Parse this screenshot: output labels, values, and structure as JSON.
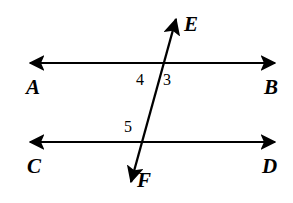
{
  "figure": {
    "background_color": "#ffffff",
    "stroke_color": "#000000",
    "width": 293,
    "height": 203
  },
  "lines": [
    {
      "name": "line-ab",
      "description": "upper horizontal line with arrowheads on both ends",
      "start_label": "A",
      "end_label": "B",
      "x1": 30,
      "y1": 63,
      "x2": 275,
      "y2": 63,
      "arrow_start": true,
      "arrow_end": true
    },
    {
      "name": "line-cd",
      "description": "lower horizontal line with arrowheads on both ends",
      "start_label": "C",
      "end_label": "D",
      "x1": 30,
      "y1": 142,
      "x2": 275,
      "y2": 142,
      "arrow_start": true,
      "arrow_end": true
    },
    {
      "name": "line-ef",
      "description": "transversal line with arrowheads on both ends",
      "start_label": "F",
      "end_label": "E",
      "x1": 131,
      "y1": 182,
      "x2": 176,
      "y2": 19,
      "arrow_start": true,
      "arrow_end": true
    }
  ],
  "intersections": [
    {
      "name": "intersection-upper",
      "x": 160,
      "y": 63
    },
    {
      "name": "intersection-lower",
      "x": 139,
      "y": 142
    }
  ],
  "point_labels": [
    {
      "name": "label-a",
      "text": "A",
      "x": 26,
      "y": 77
    },
    {
      "name": "label-b",
      "text": "B",
      "x": 264,
      "y": 77
    },
    {
      "name": "label-c",
      "text": "C",
      "x": 27,
      "y": 156
    },
    {
      "name": "label-d",
      "text": "D",
      "x": 262,
      "y": 156
    },
    {
      "name": "label-e",
      "text": "E",
      "x": 184,
      "y": 14
    },
    {
      "name": "label-f",
      "text": "F",
      "x": 137,
      "y": 170
    }
  ],
  "angle_labels": [
    {
      "name": "angle-4",
      "text": "4",
      "x": 136,
      "y": 72
    },
    {
      "name": "angle-3",
      "text": "3",
      "x": 163,
      "y": 72
    },
    {
      "name": "angle-5",
      "text": "5",
      "x": 124,
      "y": 119
    }
  ]
}
